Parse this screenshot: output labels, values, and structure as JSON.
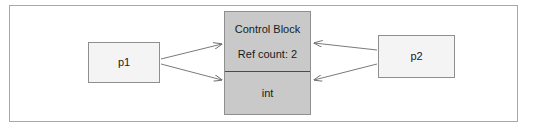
{
  "figure": {
    "frame_border_color": "#a8a8a8",
    "background_color": "#ffffff"
  },
  "nodes": {
    "p1": {
      "label": "p1",
      "fill_color": "#f4f4f4",
      "border_color": "#8f8f8f"
    },
    "p2": {
      "label": "p2",
      "fill_color": "#f4f4f4",
      "border_color": "#8f8f8f"
    },
    "control_block": {
      "fill_color": "#c9c9c9",
      "border_color": "#8f8f8f",
      "divider_color": "#4a4a4a",
      "upper": {
        "title": "Control Block",
        "ref_count_label": "Ref count: 2"
      },
      "lower": {
        "label": "int"
      }
    }
  },
  "connectors": {
    "stroke_color": "#6b6b6b",
    "arrows": [
      {
        "name": "p1-to-control-block",
        "from": "p1",
        "to": "control-block-upper",
        "direction": "right"
      },
      {
        "name": "p1-to-managed-int",
        "from": "p1",
        "to": "control-block-lower",
        "direction": "right"
      },
      {
        "name": "p2-to-control-block",
        "from": "p2",
        "to": "control-block-upper",
        "direction": "left"
      },
      {
        "name": "p2-to-managed-int",
        "from": "p2",
        "to": "control-block-lower",
        "direction": "left"
      }
    ]
  }
}
